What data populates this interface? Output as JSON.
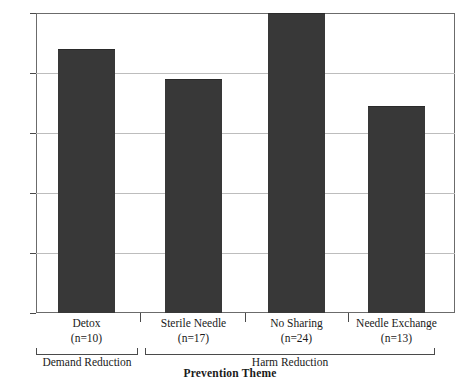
{
  "artifact_text": "·   ·                      ·          ·",
  "chart_data": {
    "type": "bar",
    "title": "",
    "xlabel": "Prevention Theme",
    "ylabel": "",
    "ylim": [
      0,
      100
    ],
    "yticks": [
      "0",
      "20",
      "40",
      "60",
      "80",
      "100"
    ],
    "ytick_values": [
      0,
      20,
      40,
      60,
      80,
      100
    ],
    "grid": true,
    "legend": "none",
    "bar_color": "#383838",
    "categories": [
      "Detox",
      "Sterile Needle",
      "No Sharing",
      "Needle Exchange"
    ],
    "category_counts": [
      "(n=10)",
      "(n=17)",
      "(n=24)",
      "(n=13)"
    ],
    "values": [
      88,
      78,
      100,
      69
    ],
    "groups": [
      {
        "label": "Demand Reduction",
        "members": [
          "Detox"
        ]
      },
      {
        "label": "Harm Reduction",
        "members": [
          "Sterile Needle",
          "No Sharing",
          "Needle Exchange"
        ]
      }
    ]
  }
}
